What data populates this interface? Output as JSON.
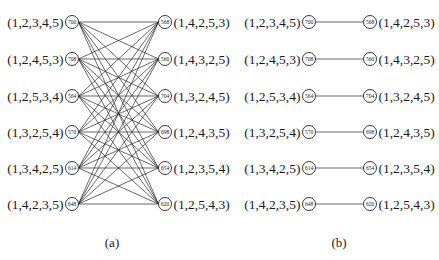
{
  "panels": [
    {
      "id": "a",
      "caption": "(a)",
      "connection": "complete-bipartite",
      "left_nodes": [
        {
          "perm": "(1,2,3,4,5)",
          "value": "700"
        },
        {
          "perm": "(1,2,4,5,3)",
          "value": "708"
        },
        {
          "perm": "(1,2,5,3,4)",
          "value": "564"
        },
        {
          "perm": "(1,3,2,5,4)",
          "value": "570"
        },
        {
          "perm": "(1,3,4,2,5)",
          "value": "614"
        },
        {
          "perm": "(1,4,2,3,5)",
          "value": "648"
        }
      ],
      "right_nodes": [
        {
          "perm": "(1,4,2,5,3)",
          "value": "568"
        },
        {
          "perm": "(1,4,3,2,5)",
          "value": "560"
        },
        {
          "perm": "(1,3,2,4,5)",
          "value": "704"
        },
        {
          "perm": "(1,2,4,3,5)",
          "value": "698"
        },
        {
          "perm": "(1,2,3,5,4)",
          "value": "654"
        },
        {
          "perm": "(1,2,5,4,3)",
          "value": "620"
        }
      ]
    },
    {
      "id": "b",
      "caption": "(b)",
      "connection": "perfect-matching",
      "left_nodes": [
        {
          "perm": "(1,2,3,4,5)",
          "value": "700"
        },
        {
          "perm": "(1,2,4,5,3)",
          "value": "708"
        },
        {
          "perm": "(1,2,5,3,4)",
          "value": "564"
        },
        {
          "perm": "(1,3,2,5,4)",
          "value": "570"
        },
        {
          "perm": "(1,3,4,2,5)",
          "value": "614"
        },
        {
          "perm": "(1,4,2,3,5)",
          "value": "648"
        }
      ],
      "right_nodes": [
        {
          "perm": "(1,4,2,5,3)",
          "value": "568"
        },
        {
          "perm": "(1,4,3,2,5)",
          "value": "560"
        },
        {
          "perm": "(1,3,2,4,5)",
          "value": "704"
        },
        {
          "perm": "(1,2,4,3,5)",
          "value": "698"
        },
        {
          "perm": "(1,2,3,5,4)",
          "value": "654"
        },
        {
          "perm": "(1,2,5,4,3)",
          "value": "620"
        }
      ]
    }
  ],
  "colors": {
    "line": "#2a2a2a",
    "text": "#1a1a1a",
    "background": "#ffffff"
  }
}
